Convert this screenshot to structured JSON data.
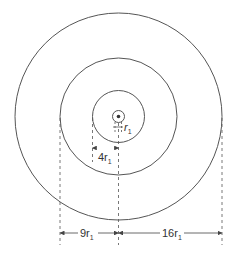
{
  "diagram": {
    "type": "concentric-circles",
    "center": {
      "x": 118.5,
      "y": 116.5
    },
    "circles": [
      {
        "name": "orbit-1",
        "radius_label": "r1",
        "px_radius": 6
      },
      {
        "name": "orbit-2",
        "radius_label": "4r1",
        "px_radius": 26
      },
      {
        "name": "orbit-3",
        "radius_label": "9r1",
        "px_radius": 58.5
      },
      {
        "name": "orbit-4",
        "radius_label": "16r1",
        "px_radius": 103.5
      }
    ],
    "labels": {
      "r1": {
        "main": "r",
        "sub": "1"
      },
      "four_r1": {
        "main": "4r",
        "sub": "1"
      },
      "nine_r1": {
        "main": "9r",
        "sub": "1"
      },
      "sixteen_r1": {
        "main": "16r",
        "sub": "1"
      }
    },
    "colors": {
      "stroke": "#555555",
      "text": "#333333"
    }
  }
}
